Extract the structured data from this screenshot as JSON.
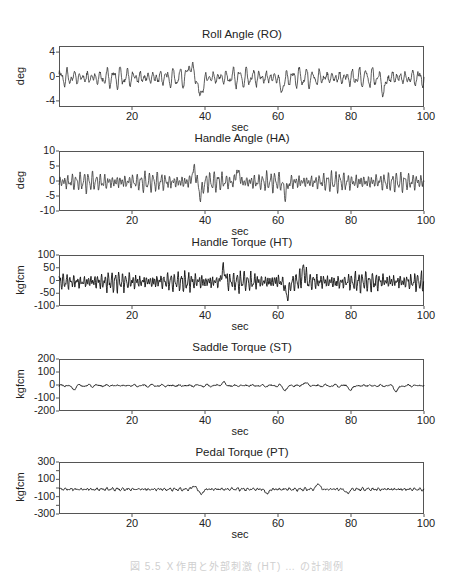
{
  "chart_data": [
    {
      "type": "line",
      "title": "Roll Angle (RO)",
      "xlabel": "sec",
      "ylabel": "deg",
      "xlim": [
        0,
        100
      ],
      "ylim": [
        -5,
        5
      ],
      "yticks": [
        4,
        0,
        -4
      ],
      "xticks": [
        20,
        40,
        60,
        80,
        100
      ],
      "grid": false,
      "series": [
        {
          "name": "RO",
          "color": "#333333",
          "amplitude": 1.3,
          "freq": 0.55,
          "noise": 0.5,
          "bias": -0.2,
          "events": [
            {
              "t": 36,
              "v": 2.5
            },
            {
              "t": 38.8,
              "v": -4.0
            },
            {
              "t": 61,
              "v": -2.6
            },
            {
              "t": 89,
              "v": -2.8
            }
          ]
        }
      ]
    },
    {
      "type": "line",
      "title": "Handle Angle (HA)",
      "xlabel": "sec",
      "ylabel": "deg",
      "xlim": [
        0,
        100
      ],
      "ylim": [
        -10,
        10
      ],
      "yticks": [
        10,
        5,
        0,
        -5,
        -10
      ],
      "xticks": [
        20,
        40,
        60,
        80,
        100
      ],
      "grid": false,
      "series": [
        {
          "name": "HA",
          "color": "#333333",
          "amplitude": 2.6,
          "freq": 0.9,
          "noise": 0.6,
          "bias": -0.3,
          "events": [
            {
              "t": 37,
              "v": 4.5
            },
            {
              "t": 38.8,
              "v": -5.5
            },
            {
              "t": 49,
              "v": 3.8
            },
            {
              "t": 62,
              "v": -4.8
            }
          ]
        }
      ]
    },
    {
      "type": "line",
      "title": "Handle Torque (HT)",
      "xlabel": "sec",
      "ylabel": "kgfcm",
      "xlim": [
        0,
        100
      ],
      "ylim": [
        -100,
        100
      ],
      "yticks": [
        100,
        50,
        0,
        -50,
        -100
      ],
      "xticks": [
        20,
        40,
        60,
        80,
        100
      ],
      "grid": false,
      "series": [
        {
          "name": "HT",
          "color": "#111111",
          "amplitude": 30,
          "freq": 1.05,
          "noise": 12,
          "bias": -5,
          "events": [
            {
              "t": 45,
              "v": 50
            },
            {
              "t": 62.5,
              "v": -75
            },
            {
              "t": 67,
              "v": 48
            }
          ]
        }
      ]
    },
    {
      "type": "line",
      "title": "Saddle Torque (ST)",
      "xlabel": "sec",
      "ylabel": "kgfcm",
      "xlim": [
        0,
        100
      ],
      "ylim": [
        -200,
        200
      ],
      "yticks": [
        200,
        100,
        0,
        -100,
        -200
      ],
      "xticks": [
        20,
        40,
        60,
        80,
        100
      ],
      "grid": false,
      "series": [
        {
          "name": "ST",
          "color": "#111111",
          "amplitude": 8,
          "freq": 0.4,
          "noise": 7,
          "bias": -5,
          "events": [
            {
              "t": 4,
              "v": -40
            },
            {
              "t": 45,
              "v": 25
            },
            {
              "t": 62,
              "v": -45
            },
            {
              "t": 67.5,
              "v": 25
            },
            {
              "t": 80,
              "v": -45
            },
            {
              "t": 92.5,
              "v": -60
            }
          ]
        }
      ]
    },
    {
      "type": "line",
      "title": "Pedal Torque (PT)",
      "xlabel": "sec",
      "ylabel": "kgfcm",
      "xlim": [
        0,
        100
      ],
      "ylim": [
        -300,
        300
      ],
      "yticks": [
        300,
        100,
        -100,
        -300
      ],
      "yminor": [
        200,
        0,
        -200
      ],
      "xticks": [
        20,
        40,
        60,
        80,
        100
      ],
      "grid": false,
      "series": [
        {
          "name": "PT",
          "color": "#111111",
          "amplitude": 14,
          "freq": 0.7,
          "noise": 10,
          "bias": -15,
          "events": [
            {
              "t": 37,
              "v": 30
            },
            {
              "t": 39,
              "v": -80
            },
            {
              "t": 57,
              "v": -75
            },
            {
              "t": 71,
              "v": 60
            },
            {
              "t": 79,
              "v": -70
            }
          ]
        }
      ]
    }
  ],
  "caption": "図 5.5  Ｘ作用と外部刺激 (HT) … の計測例"
}
